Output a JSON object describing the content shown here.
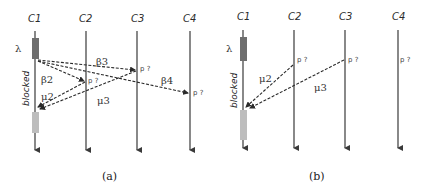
{
  "figure": {
    "panels": [
      {
        "id": "a",
        "caption": "(a)",
        "processes": [
          "C1",
          "C2",
          "C3",
          "C4"
        ],
        "lambda_label": "λ",
        "blocked_label": "blocked",
        "messages": [
          {
            "label": "β3",
            "from": "C1",
            "to": "C3",
            "kind": "request"
          },
          {
            "label": "β2",
            "from": "C1",
            "to": "C2",
            "kind": "request"
          },
          {
            "label": "β4",
            "from": "C1",
            "to": "C4",
            "kind": "request"
          },
          {
            "label": "μ2",
            "from": "C2",
            "to": "C1",
            "kind": "reply"
          },
          {
            "label": "μ3",
            "from": "C3",
            "to": "C1",
            "kind": "reply"
          }
        ],
        "pending_labels": [
          "p ?",
          "p ?",
          "p ?"
        ]
      },
      {
        "id": "b",
        "caption": "(b)",
        "processes": [
          "C1",
          "C2",
          "C3",
          "C4"
        ],
        "lambda_label": "λ",
        "blocked_label": "blocked",
        "messages": [
          {
            "label": "μ2",
            "from": "C2",
            "to": "C1",
            "kind": "reply"
          },
          {
            "label": "μ3",
            "from": "C3",
            "to": "C1",
            "kind": "reply"
          }
        ],
        "pending_labels": [
          "p ?",
          "p ?",
          "p ?"
        ]
      }
    ],
    "colors": {
      "active_box": "#6e6e6e",
      "resumed_box": "#bdbdbd",
      "line": "#3a3a3a"
    }
  }
}
